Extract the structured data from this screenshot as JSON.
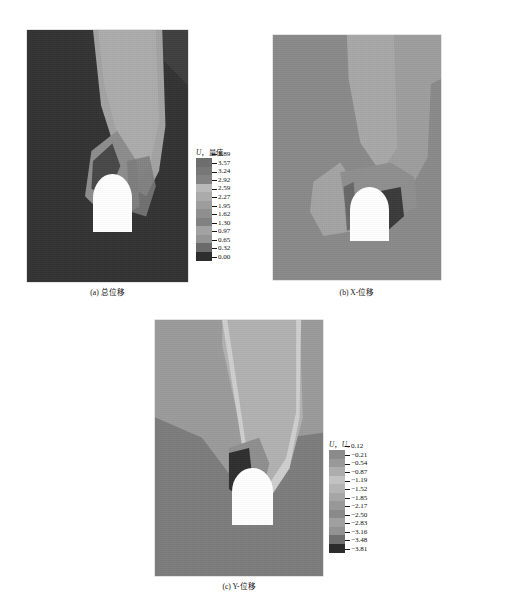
{
  "figure": {
    "panels": [
      {
        "id": "a",
        "caption": "(a) 总位移",
        "legend": {
          "title_var": "U",
          "title_sep": "，",
          "title_component": "量值",
          "labels": [
            "3.89",
            "3.57",
            "3.24",
            "2.92",
            "2.59",
            "2.27",
            "1.95",
            "1.62",
            "1.30",
            "0.97",
            "0.65",
            "0.32",
            "0.00"
          ],
          "colors": [
            "#6e6e6e",
            "#777777",
            "#828282",
            "#b9b9b9",
            "#ababab",
            "#9d9d9d",
            "#8f8f8f",
            "#818181",
            "#a2a2a2",
            "#949494",
            "#6a6a6a",
            "#2e2e2e"
          ]
        }
      },
      {
        "id": "b",
        "caption": "(b) X-位移",
        "legend": {
          "title_var": "U",
          "title_sep": "，",
          "title_component": "U₁",
          "labels": [
            "1.29",
            "1.05",
            "0.81",
            "0.57",
            "0.32",
            "0.08",
            "−0.16",
            "−0.40",
            "−0.65",
            "−0.89",
            "−1.13",
            "−1.37",
            "−1.62"
          ],
          "colors": [
            "#767676",
            "#8b8b8b",
            "#b0b0b0",
            "#a6a6a6",
            "#9a9a9a",
            "#8e8e8e",
            "#888888",
            "#838383",
            "#8f8f8f",
            "#adadad",
            "#7a7a7a",
            "#2b2b2b"
          ]
        }
      },
      {
        "id": "c",
        "caption": "(c) Y-位移",
        "legend": {
          "title_var": "U",
          "title_sep": "，",
          "title_component": "U₂",
          "labels": [
            "0.12",
            "−0.21",
            "−0.54",
            "−0.87",
            "−1.19",
            "−1.52",
            "−1.85",
            "−2.17",
            "−2.50",
            "−2.83",
            "−3.16",
            "−3.48",
            "−3.81"
          ],
          "colors": [
            "#8b8b8b",
            "#999999",
            "#adadad",
            "#c2c2c2",
            "#b4b4b4",
            "#a6a6a6",
            "#989898",
            "#8a8a8a",
            "#a0a0a0",
            "#929292",
            "#6f6f6f",
            "#2c2c2c"
          ]
        }
      }
    ]
  }
}
